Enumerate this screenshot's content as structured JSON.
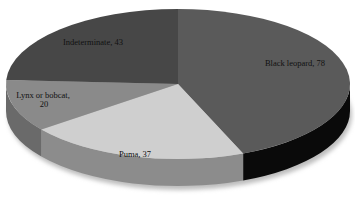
{
  "chart_data": {
    "type": "pie",
    "style": "3d",
    "title": "",
    "categories": [
      "Black leopard",
      "Puma",
      "Lynx or bobcat",
      "Indeterminate"
    ],
    "values": [
      78,
      37,
      20,
      43
    ],
    "labels": [
      "Black leopard, 78",
      "Puma, 37",
      "Lynx or bobcat,",
      "20",
      "Indeterminate, 43"
    ],
    "colors": {
      "Black leopard": "#5a5a5a",
      "Puma": "#cfcfcf",
      "Lynx or bobcat": "#8a8a8a",
      "Indeterminate": "#474747"
    },
    "side_colors": {
      "Black leopard": "#0a0a0a",
      "Puma": "#8c8c8c",
      "Lynx or bobcat": "#6a6a6a",
      "Indeterminate": "#3a3a3a"
    },
    "start_angle_deg": 0,
    "direction": "clockwise",
    "legend": "none"
  }
}
